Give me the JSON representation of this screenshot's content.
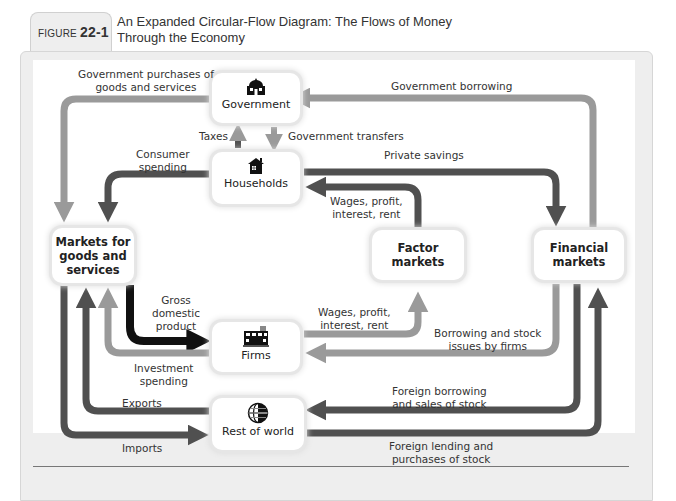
{
  "figure": {
    "label_prefix": "FIGURE",
    "number": "22-1",
    "title_line1": "An Expanded Circular-Flow Diagram: The Flows of Money",
    "title_line2": "Through the Economy"
  },
  "nodes": {
    "government": {
      "label": "Government",
      "icon": "government-building-icon"
    },
    "households": {
      "label": "Households",
      "icon": "house-icon"
    },
    "markets_goods": {
      "label_line1": "Markets for",
      "label_line2": "goods and",
      "label_line3": "services"
    },
    "factor_markets": {
      "label_line1": "Factor",
      "label_line2": "markets"
    },
    "financial_markets": {
      "label_line1": "Financial",
      "label_line2": "markets"
    },
    "firms": {
      "label": "Firms",
      "icon": "factory-icon"
    },
    "rest_of_world": {
      "label": "Rest of world",
      "icon": "globe-icon"
    }
  },
  "flows": {
    "gov_purchases": {
      "line1": "Government purchases of",
      "line2": "goods and services"
    },
    "gov_borrowing": {
      "line1": "Government borrowing"
    },
    "taxes": {
      "line1": "Taxes"
    },
    "gov_transfers": {
      "line1": "Government transfers"
    },
    "consumer_spending": {
      "line1": "Consumer",
      "line2": "spending"
    },
    "private_savings": {
      "line1": "Private savings"
    },
    "wages_to_households": {
      "line1": "Wages, profit,",
      "line2": "interest, rent"
    },
    "gdp": {
      "line1": "Gross",
      "line2": "domestic",
      "line3": "product"
    },
    "wages_from_firms": {
      "line1": "Wages, profit,",
      "line2": "interest, rent"
    },
    "borrowing_stock": {
      "line1": "Borrowing and stock",
      "line2": "issues by firms"
    },
    "investment_spending": {
      "line1": "Investment",
      "line2": "spending"
    },
    "foreign_borrowing": {
      "line1": "Foreign borrowing",
      "line2": "and sales of stock"
    },
    "exports": {
      "line1": "Exports"
    },
    "imports": {
      "line1": "Imports"
    },
    "foreign_lending": {
      "line1": "Foreign lending and",
      "line2": "purchases of stock"
    }
  },
  "colors": {
    "dark_flow": "#505050",
    "light_flow": "#999999",
    "black_flow": "#111111",
    "panel_bg": "#eeeeee"
  }
}
